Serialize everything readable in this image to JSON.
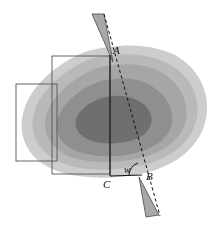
{
  "figure": {
    "width": 223,
    "height": 232,
    "background": "#ffffff"
  },
  "contours": {
    "description": "Nested irregular closed contour bands, darkening toward the centre",
    "bands": [
      {
        "name": "band-1-outermost",
        "color": "#cdcdcd",
        "level": 1
      },
      {
        "name": "band-2",
        "color": "#b9b9b9",
        "level": 2
      },
      {
        "name": "band-3",
        "color": "#a6a6a6",
        "level": 3
      },
      {
        "name": "band-4",
        "color": "#8f8f8f",
        "level": 4
      },
      {
        "name": "band-5-innermost",
        "color": "#6f6f6f",
        "level": 5
      }
    ]
  },
  "rectangles": [
    {
      "name": "rect-upper-right",
      "x": 52,
      "y": 56,
      "width": 58,
      "height": 118,
      "stroke": "#555555"
    },
    {
      "name": "rect-lower-left",
      "x": 16,
      "y": 84,
      "width": 41,
      "height": 77,
      "stroke": "#555555"
    }
  ],
  "points": {
    "A": {
      "label": "A",
      "x": 110,
      "y": 57,
      "label_x": 113,
      "label_y": 54
    },
    "B": {
      "label": "B",
      "x": 142,
      "y": 175,
      "label_x": 146,
      "label_y": 179
    },
    "C": {
      "label": "C",
      "x": 110,
      "y": 176,
      "label_x": 104,
      "label_y": 187
    }
  },
  "angle": {
    "label": "w",
    "vertex": "B",
    "label_x": 126,
    "label_y": 172,
    "arc_radius": 13
  },
  "lines": [
    {
      "name": "line-AC",
      "style": "solid",
      "from": "A",
      "to": "C",
      "stroke": "#111111"
    },
    {
      "name": "line-AB",
      "style": "dashed",
      "from": "A",
      "to": "B",
      "stroke": "#111111"
    },
    {
      "name": "line-CB",
      "style": "solid",
      "from": "C",
      "to": "B",
      "stroke": "#111111"
    }
  ],
  "wedges": [
    {
      "name": "wedge-top",
      "fill": "#a8a8a8",
      "stroke": "#555555",
      "points": "92,14 104,14 113,62"
    },
    {
      "name": "wedge-bottom",
      "fill": "#a8a8a8",
      "stroke": "#555555",
      "points": "139,177 159,215 146,217"
    }
  ]
}
